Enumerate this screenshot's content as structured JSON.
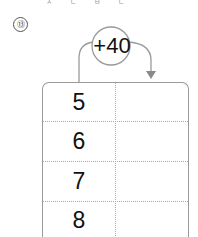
{
  "top_partial_text": "ㅈ ㄷ ㅂ ㄷ",
  "problem": {
    "number": "⑬",
    "operation": "+40",
    "table": {
      "rows": [
        {
          "input": "5",
          "output": ""
        },
        {
          "input": "6",
          "output": ""
        },
        {
          "input": "7",
          "output": ""
        },
        {
          "input": "8",
          "output": ""
        }
      ]
    }
  },
  "colors": {
    "line": "#9a9a9a",
    "text": "#111111"
  }
}
